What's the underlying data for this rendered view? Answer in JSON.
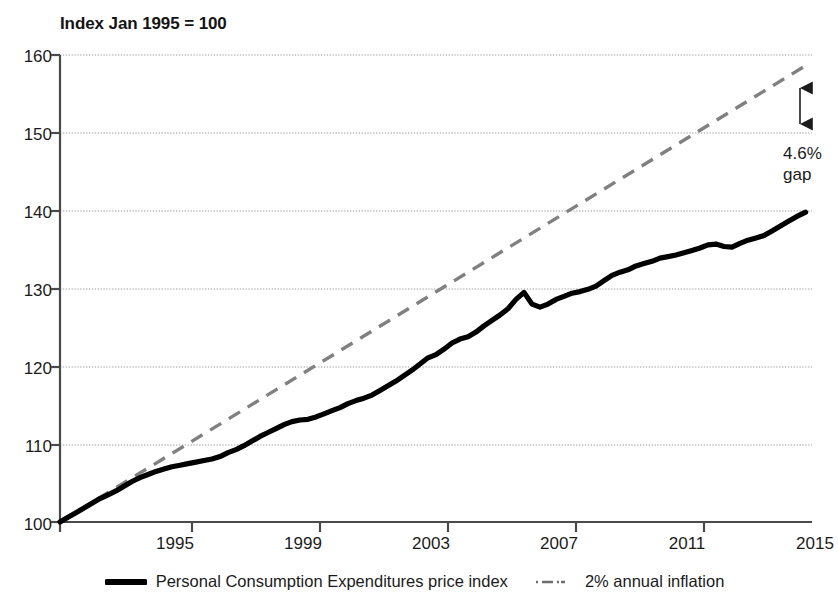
{
  "chart_data": {
    "type": "line",
    "title": "Index Jan 1995 = 100",
    "xlabel": "",
    "ylabel": "",
    "ylim": [
      100,
      160
    ],
    "xlim": [
      1994.0,
      2017.5
    ],
    "yticks": [
      "100",
      "110",
      "120",
      "130",
      "140",
      "150",
      "160"
    ],
    "xticks": [
      "1995",
      "1999",
      "2003",
      "2007",
      "2011",
      "2015"
    ],
    "grid": "horizontal dotted gridlines at each y tick",
    "legend_position": "bottom-center",
    "annotations": [
      {
        "name": "gap-annotation",
        "line1": "4.6%",
        "line2": "gap",
        "note": "double-headed vertical arrow from 2% trend line (157) down to PCE index (149.7) at end of series"
      }
    ],
    "series": [
      {
        "name": "Personal Consumption Expenditures price index",
        "style": "solid",
        "color": "#000000",
        "width": 5,
        "x": [
          1994.0,
          1994.25,
          1994.5,
          1994.75,
          1995.0,
          1995.25,
          1995.5,
          1995.75,
          1996.0,
          1996.25,
          1996.5,
          1996.75,
          1997.0,
          1997.25,
          1997.5,
          1997.75,
          1998.0,
          1998.25,
          1998.5,
          1998.75,
          1999.0,
          1999.25,
          1999.5,
          1999.75,
          2000.0,
          2000.25,
          2000.5,
          2000.75,
          2001.0,
          2001.25,
          2001.5,
          2001.75,
          2002.0,
          2002.25,
          2002.5,
          2002.75,
          2003.0,
          2003.25,
          2003.5,
          2003.75,
          2004.0,
          2004.25,
          2004.5,
          2004.75,
          2005.0,
          2005.25,
          2005.5,
          2005.75,
          2006.0,
          2006.25,
          2006.5,
          2006.75,
          2007.0,
          2007.25,
          2007.5,
          2007.75,
          2008.0,
          2008.25,
          2008.5,
          2008.75,
          2009.0,
          2009.25,
          2009.5,
          2009.75,
          2010.0,
          2010.25,
          2010.5,
          2010.75,
          2011.0,
          2011.25,
          2011.5,
          2011.75,
          2012.0,
          2012.25,
          2012.5,
          2012.75,
          2013.0,
          2013.25,
          2013.5,
          2013.75,
          2014.0,
          2014.25,
          2014.5,
          2014.75,
          2015.0,
          2015.25,
          2015.5,
          2015.75,
          2016.0,
          2016.25,
          2016.5,
          2016.75,
          2017.0,
          2017.3
        ],
        "y": [
          100.0,
          100.6,
          101.2,
          101.8,
          102.4,
          103.0,
          103.5,
          104.0,
          104.6,
          105.2,
          105.7,
          106.1,
          106.5,
          106.8,
          107.1,
          107.3,
          107.5,
          107.7,
          107.9,
          108.1,
          108.4,
          108.9,
          109.3,
          109.8,
          110.4,
          111.0,
          111.5,
          112.0,
          112.5,
          112.9,
          113.1,
          113.2,
          113.5,
          113.9,
          114.3,
          114.7,
          115.2,
          115.6,
          115.9,
          116.3,
          116.9,
          117.5,
          118.1,
          118.8,
          119.5,
          120.3,
          121.1,
          121.5,
          122.2,
          123.0,
          123.5,
          123.8,
          124.4,
          125.2,
          125.9,
          126.6,
          127.4,
          128.6,
          129.5,
          128.0,
          127.6,
          128.0,
          128.6,
          129.0,
          129.4,
          129.6,
          129.9,
          130.3,
          131.0,
          131.7,
          132.1,
          132.4,
          132.9,
          133.2,
          133.5,
          133.9,
          134.1,
          134.3,
          134.6,
          134.9,
          135.2,
          135.6,
          135.7,
          135.4,
          135.3,
          135.8,
          136.2,
          136.5,
          136.8,
          137.4,
          138.0,
          138.6,
          139.2,
          139.8
        ]
      },
      {
        "name": "2% annual inflation",
        "style": "dashed",
        "color": "#808080",
        "width": 3,
        "x": [
          1994.0,
          2017.3
        ],
        "y": [
          100.0,
          146.0
        ]
      }
    ],
    "value_labels": {
      "pce_end": "149.7",
      "trend_end": "157.0",
      "gap_pct": "4.6%"
    }
  },
  "legend": [
    {
      "marker": "solid-line",
      "label": "Personal Consumption Expenditures price index"
    },
    {
      "marker": "dash-dot-line",
      "label": "2% annual inflation"
    }
  ],
  "colors": {
    "series_primary": "#000000",
    "series_trend": "#808080",
    "axis": "#4a4a4a",
    "gridline": "#9a9a9a",
    "text": "#1b1b1b"
  }
}
